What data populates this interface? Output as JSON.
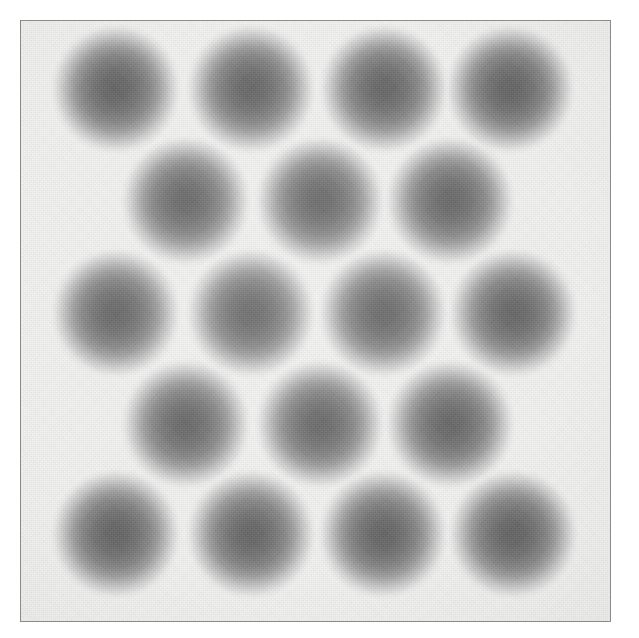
{
  "figure": {
    "kind": "scanned-grayscale-plate",
    "caption": ""
  },
  "canvas": {
    "width": 639,
    "height": 638,
    "outer_background": "#ffffff",
    "plate_background": "#f2f2f1"
  },
  "frame": {
    "name": "plate-border",
    "left": 20,
    "top": 20,
    "width": 591,
    "height": 602,
    "border_width": 1,
    "border_color": "#8b8b8b"
  },
  "dot_style": {
    "core_color": "#636363",
    "mid_color": "#9d9d9d",
    "edge_color": "#ebebea",
    "diameter": 132,
    "shape": "circle",
    "edge": "soft-gaussian-falloff"
  },
  "chart_data": {
    "type": "scatter",
    "title": "",
    "xlabel": "",
    "ylabel": "",
    "xlim": [
      0,
      591
    ],
    "ylim": [
      0,
      602
    ],
    "grid": false,
    "legend": null,
    "lattice": "hexagonal-close-packed",
    "row_counts": [
      4,
      3,
      4,
      3,
      4
    ],
    "total_points": 18,
    "row_pitch": 110,
    "column_pitch": 131,
    "row_offset": 66,
    "points": [
      {
        "row": 1,
        "col": 1,
        "cx": 95,
        "cy": 68,
        "r": 66
      },
      {
        "row": 1,
        "col": 2,
        "cx": 230,
        "cy": 68,
        "r": 66
      },
      {
        "row": 1,
        "col": 3,
        "cx": 363,
        "cy": 68,
        "r": 66
      },
      {
        "row": 1,
        "col": 4,
        "cx": 489,
        "cy": 68,
        "r": 66
      },
      {
        "row": 2,
        "col": 1,
        "cx": 165,
        "cy": 180,
        "r": 66
      },
      {
        "row": 2,
        "col": 2,
        "cx": 299,
        "cy": 180,
        "r": 66
      },
      {
        "row": 2,
        "col": 3,
        "cx": 429,
        "cy": 180,
        "r": 66
      },
      {
        "row": 3,
        "col": 1,
        "cx": 95,
        "cy": 292,
        "r": 66
      },
      {
        "row": 3,
        "col": 2,
        "cx": 230,
        "cy": 292,
        "r": 66
      },
      {
        "row": 3,
        "col": 3,
        "cx": 362,
        "cy": 292,
        "r": 66
      },
      {
        "row": 3,
        "col": 4,
        "cx": 492,
        "cy": 292,
        "r": 66
      },
      {
        "row": 4,
        "col": 1,
        "cx": 165,
        "cy": 403,
        "r": 66
      },
      {
        "row": 4,
        "col": 2,
        "cx": 299,
        "cy": 403,
        "r": 66
      },
      {
        "row": 4,
        "col": 3,
        "cx": 429,
        "cy": 403,
        "r": 66
      },
      {
        "row": 5,
        "col": 1,
        "cx": 95,
        "cy": 513,
        "r": 66
      },
      {
        "row": 5,
        "col": 2,
        "cx": 230,
        "cy": 513,
        "r": 66
      },
      {
        "row": 5,
        "col": 3,
        "cx": 362,
        "cy": 513,
        "r": 66
      },
      {
        "row": 5,
        "col": 4,
        "cx": 492,
        "cy": 513,
        "r": 66
      }
    ]
  }
}
